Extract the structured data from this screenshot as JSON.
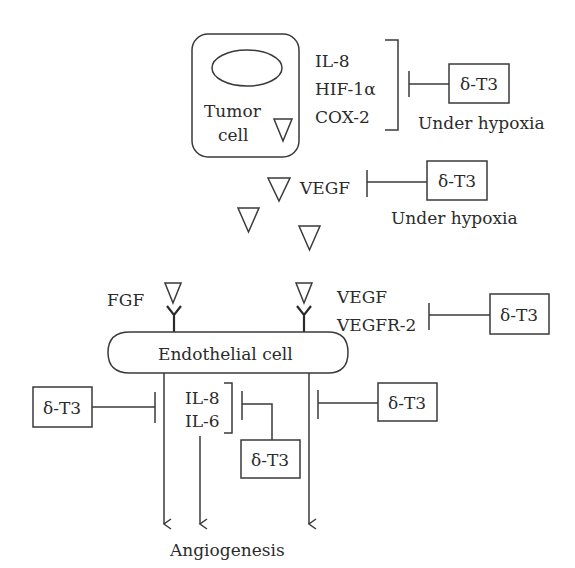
{
  "diagram": {
    "tumor_cell": {
      "label_line1": "Tumor",
      "label_line2": "cell"
    },
    "tumor_factors": [
      "IL-8",
      "HIF-1α",
      "COX-2"
    ],
    "inhibitor_label": "δ-T3",
    "condition_label": "Under hypoxia",
    "secreted_factor": "VEGF",
    "ligands": {
      "left": "FGF",
      "right_line1": "VEGF",
      "right_line2": "VEGFR-2"
    },
    "endothelial_cell": {
      "label": "Endothelial cell"
    },
    "endothelial_factors": [
      "IL-8",
      "IL-6"
    ],
    "outcome": "Angiogenesis",
    "inhibitors": [
      {
        "label": "δ-T3",
        "target": "IL-8 / HIF-1α / COX-2",
        "note": "Under hypoxia"
      },
      {
        "label": "δ-T3",
        "target": "VEGF",
        "note": "Under hypoxia"
      },
      {
        "label": "δ-T3",
        "target": "VEGF / VEGFR-2"
      },
      {
        "label": "δ-T3",
        "target": "FGF pathway"
      },
      {
        "label": "δ-T3",
        "target": "IL-8 / IL-6"
      },
      {
        "label": "δ-T3",
        "target": "VEGF pathway"
      }
    ]
  },
  "colors": {
    "line": "#3a3a3a",
    "text": "#2b2b2b",
    "background": "#ffffff"
  }
}
